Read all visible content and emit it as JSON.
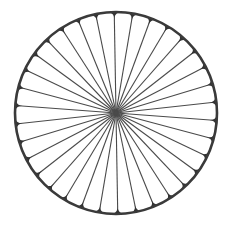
{
  "figure": {
    "type": "spoked-wheel",
    "center": [
      116,
      113
    ],
    "radius": 101,
    "spoke_count": 34,
    "start_angle_deg": -91,
    "rim_stroke_width": 2.6,
    "spoke_stroke_width": 1.1,
    "nub_size": 4.5,
    "colors": {
      "background": "#ffffff",
      "rim": "#3a3a3a",
      "spokes": "#4a4a4a",
      "nubs": "#333333"
    }
  }
}
